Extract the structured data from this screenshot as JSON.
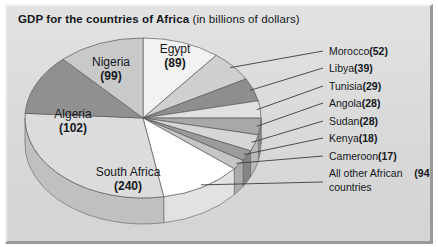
{
  "chart_data": {
    "type": "pie",
    "title": "GDP for the countries of Africa",
    "subtitle": "(in billions of dollars)",
    "unit": "billions of dollars",
    "total": 835,
    "categories": [
      "South Africa",
      "Algeria",
      "Nigeria",
      "Egypt",
      "Morocco",
      "Libya",
      "Tunisia",
      "Angola",
      "Sudan",
      "Kenya",
      "Cameroon",
      "All other African countries"
    ],
    "values": [
      240,
      102,
      99,
      89,
      52,
      39,
      29,
      28,
      28,
      18,
      17,
      94
    ],
    "legend_position": "right",
    "grid": false,
    "xlabel": "",
    "ylabel": "",
    "slices": [
      {
        "name": "Egypt",
        "value": 89,
        "label": "Egypt",
        "value_text": "(89)",
        "color": "#f2f2f2",
        "side_color": "#d8d8d8",
        "label_placement": "inside",
        "labeled_on_slice": true
      },
      {
        "name": "Morocco",
        "value": 52,
        "label": "Morocco",
        "value_text": "(52)",
        "color": "#cfcfcf",
        "side_color": "#b4b4b4",
        "label_placement": "callout",
        "labeled_on_slice": false
      },
      {
        "name": "Libya",
        "value": 39,
        "label": "Libya",
        "value_text": "(39)",
        "color": "#8e8e8e",
        "side_color": "#777777",
        "label_placement": "callout",
        "labeled_on_slice": false
      },
      {
        "name": "Tunisia",
        "value": 29,
        "label": "Tunisia",
        "value_text": "(29)",
        "color": "#e0e0e0",
        "side_color": "#c4c4c4",
        "label_placement": "callout",
        "labeled_on_slice": false
      },
      {
        "name": "Angola",
        "value": 28,
        "label": "Angola",
        "value_text": "(28)",
        "color": "#a8a8a8",
        "side_color": "#8f8f8f",
        "label_placement": "callout",
        "labeled_on_slice": false
      },
      {
        "name": "Sudan",
        "value": 28,
        "label": "Sudan",
        "value_text": "(28)",
        "color": "#d6d6d6",
        "side_color": "#bababa",
        "label_placement": "callout",
        "labeled_on_slice": false
      },
      {
        "name": "Kenya",
        "value": 18,
        "label": "Kenya",
        "value_text": "(18)",
        "color": "#9b9b9b",
        "side_color": "#848484",
        "label_placement": "callout",
        "labeled_on_slice": false
      },
      {
        "name": "Cameroon",
        "value": 17,
        "label": "Cameroon",
        "value_text": "(17)",
        "color": "#c6c6c6",
        "side_color": "#ababab",
        "label_placement": "callout",
        "labeled_on_slice": false
      },
      {
        "name": "All other African countries",
        "value": 94,
        "label": "All other African countries",
        "value_text": "(94)",
        "color": "#ffffff",
        "side_color": "#e2e2e2",
        "label_placement": "callout",
        "labeled_on_slice": false
      },
      {
        "name": "South Africa",
        "value": 240,
        "label": "South Africa",
        "value_text": "(240)",
        "color": "#dcdcdc",
        "side_color": "#c0c0c0",
        "label_placement": "inside",
        "labeled_on_slice": true
      },
      {
        "name": "Algeria",
        "value": 102,
        "label": "Algeria",
        "value_text": "(102)",
        "color": "#909090",
        "side_color": "#7a7a7a",
        "label_placement": "inside",
        "labeled_on_slice": true
      },
      {
        "name": "Nigeria",
        "value": 99,
        "label": "Nigeria",
        "value_text": "(99)",
        "color": "#c9c9c9",
        "side_color": "#adadad",
        "label_placement": "inside",
        "labeled_on_slice": true
      }
    ]
  },
  "legend": [
    {
      "label": "Morocco",
      "value": "(52)"
    },
    {
      "label": "Libya",
      "value": "(39)"
    },
    {
      "label": "Tunisia",
      "value": "(29)"
    },
    {
      "label": "Angola",
      "value": "(28)"
    },
    {
      "label": "Sudan",
      "value": "(28)"
    },
    {
      "label": "Kenya",
      "value": "(18)"
    },
    {
      "label": "Cameroon",
      "value": "(17)"
    },
    {
      "label": "All other African countries",
      "value": "(94)"
    }
  ],
  "colors": {
    "panel_background": "#dcdcdc",
    "text": "#14181c",
    "outline": "#5a5a5a",
    "leader_line": "#3c3c3c"
  }
}
